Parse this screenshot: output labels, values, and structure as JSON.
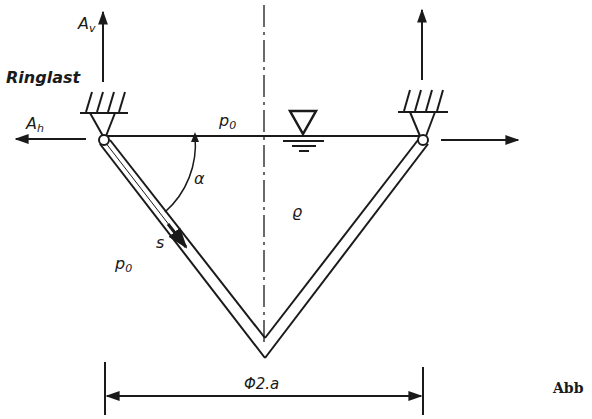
{
  "figure": {
    "labels": {
      "av_main": "A",
      "av_sub": "v",
      "ringlast": "Ringlast",
      "ah_main": "A",
      "ah_sub": "h",
      "p0_top_main": "p",
      "p0_top_sub": "0",
      "p0_left_main": "p",
      "p0_left_sub": "0",
      "alpha": "α",
      "rho": "ϱ",
      "s": "s",
      "diameter": "Φ2.a"
    },
    "caption": "Abb",
    "colors": {
      "ink": "#1a1a1a",
      "background": "#ffffff"
    }
  }
}
